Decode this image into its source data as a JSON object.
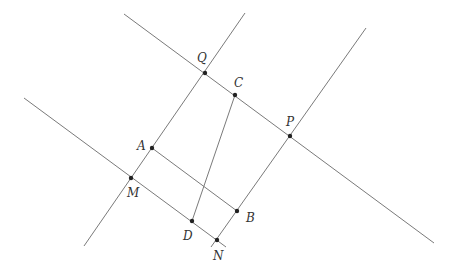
{
  "diagram": {
    "type": "geometry",
    "line_color": "#7a7a7a",
    "point_color": "#222222",
    "lines": [
      {
        "id": "line-QP",
        "x1": 124,
        "y1": 14,
        "x2": 434,
        "y2": 243
      },
      {
        "id": "line-MN",
        "x1": 24,
        "y1": 98,
        "x2": 226,
        "y2": 247
      },
      {
        "id": "line-MQ",
        "x1": 84,
        "y1": 246,
        "x2": 245,
        "y2": 13
      },
      {
        "id": "line-NP",
        "x1": 211,
        "y1": 247,
        "x2": 366,
        "y2": 28
      }
    ],
    "segments": [
      {
        "id": "segment-AB",
        "x1": 152,
        "y1": 148,
        "x2": 237,
        "y2": 211
      },
      {
        "id": "segment-CD",
        "x1": 235,
        "y1": 95,
        "x2": 192,
        "y2": 221
      }
    ],
    "points": [
      {
        "label": "Q",
        "x": 205,
        "y": 73,
        "lx": 197,
        "ly": 62
      },
      {
        "label": "C",
        "x": 235,
        "y": 95,
        "lx": 234,
        "ly": 87
      },
      {
        "label": "P",
        "x": 290,
        "y": 136,
        "lx": 286,
        "ly": 126
      },
      {
        "label": "A",
        "x": 152,
        "y": 148,
        "lx": 137,
        "ly": 150
      },
      {
        "label": "M",
        "x": 131,
        "y": 178,
        "lx": 127,
        "ly": 197
      },
      {
        "label": "B",
        "x": 237,
        "y": 211,
        "lx": 246,
        "ly": 222
      },
      {
        "label": "D",
        "x": 192,
        "y": 221,
        "lx": 183,
        "ly": 240
      },
      {
        "label": "N",
        "x": 217,
        "y": 240,
        "lx": 213,
        "ly": 260
      }
    ]
  }
}
